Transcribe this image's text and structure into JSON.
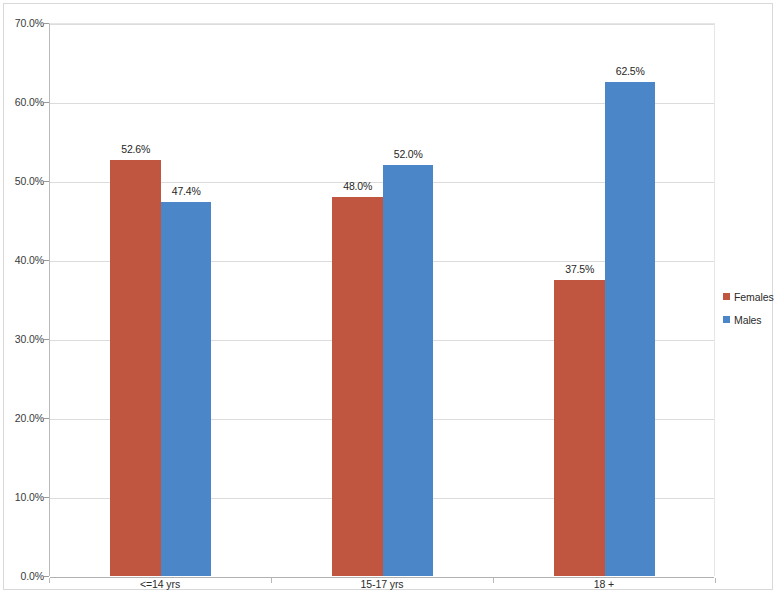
{
  "chart_data": {
    "type": "bar",
    "title": "",
    "subtitle": "",
    "xlabel": "",
    "ylabel": "",
    "categories": [
      "<=14 yrs",
      "15-17 yrs",
      "18 +"
    ],
    "series": [
      {
        "name": "Females",
        "color": "#C0563F",
        "values": [
          52.6,
          48.0,
          37.5
        ],
        "labels": [
          "52.6%",
          "48.0%",
          "37.5%"
        ]
      },
      {
        "name": "Males",
        "color": "#4A86C8",
        "values": [
          47.4,
          52.0,
          62.5
        ],
        "labels": [
          "47.4%",
          "52.0%",
          "62.5%"
        ]
      }
    ],
    "ylim": [
      0,
      70
    ],
    "ytick_values": [
      0,
      10,
      20,
      30,
      40,
      50,
      60,
      70
    ],
    "ytick_labels": [
      "0.0%",
      "10.0%",
      "20.0%",
      "30.0%",
      "40.0%",
      "50.0%",
      "60.0%",
      "70.0%"
    ],
    "grid": "horizontal",
    "legend_position": "right",
    "bar_gap": "none",
    "value_labels": true
  },
  "legend": {
    "items": [
      {
        "label": "Females",
        "color": "#C0563F"
      },
      {
        "label": "Males",
        "color": "#4A86C8"
      }
    ]
  }
}
